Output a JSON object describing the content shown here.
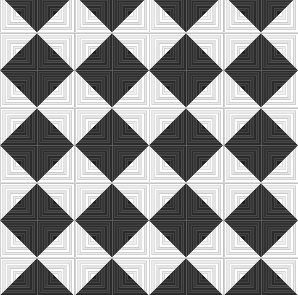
{
  "artwork": {
    "title": "Log Cabin Quilt Pattern",
    "pattern_name": "log-cabin",
    "width_px": 298,
    "height_px": 295,
    "grid_columns": 8,
    "grid_rows": 8,
    "block_size_px": 37.25,
    "log_count_per_block": 7,
    "description": "Monochrome log cabin quilt: nested square logs split on the diagonal into a dark half and a light half. Adjacent blocks are mirrored, forming alternating dark and light triangular chevrons."
  },
  "colors": {
    "dark": "#2b2b2b",
    "dark_alt": "#3a3a3a",
    "light": "#ffffff",
    "light_alt": "#ededed",
    "seam": "#8a8a8a",
    "background": "#f2f2f0",
    "center_dark": "#1d1d1d",
    "center_light": "#fbfbfb"
  },
  "block_geometry": {
    "viewbox": "0 0 100 100",
    "note": "Concentric square rings drawn outer-to-inner; each ring is split by the main diagonal (top-left to bottom-right). Upper-right side of the diagonal is the light family, lower-left side is the dark family.",
    "ring_insets": [
      0,
      7,
      14,
      21,
      28,
      35,
      42
    ],
    "ring_shades_dark": [
      "#2b2b2b",
      "#333333",
      "#2b2b2b",
      "#383838",
      "#2b2b2b",
      "#303030",
      "#242424"
    ],
    "ring_shades_light": [
      "#ffffff",
      "#ebebeb",
      "#ffffff",
      "#e4e4e4",
      "#ffffff",
      "#efefef",
      "#fcfcfc"
    ]
  },
  "orientation_map": {
    "legend": {
      "0": "none",
      "h": "mirrored horizontally",
      "v": "mirrored vertically",
      "hv": "rotated 180 degrees"
    },
    "rows": [
      [
        "hv",
        "v",
        "hv",
        "v",
        "hv",
        "v",
        "hv",
        "v"
      ],
      [
        "h",
        "0",
        "h",
        "0",
        "h",
        "0",
        "h",
        "0"
      ],
      [
        "hv",
        "v",
        "hv",
        "v",
        "hv",
        "v",
        "hv",
        "v"
      ],
      [
        "h",
        "0",
        "h",
        "0",
        "h",
        "0",
        "h",
        "0"
      ],
      [
        "hv",
        "v",
        "hv",
        "v",
        "hv",
        "v",
        "hv",
        "v"
      ],
      [
        "h",
        "0",
        "h",
        "0",
        "h",
        "0",
        "h",
        "0"
      ],
      [
        "hv",
        "v",
        "hv",
        "v",
        "hv",
        "v",
        "hv",
        "v"
      ],
      [
        "h",
        "0",
        "h",
        "0",
        "h",
        "0",
        "h",
        "0"
      ]
    ]
  }
}
